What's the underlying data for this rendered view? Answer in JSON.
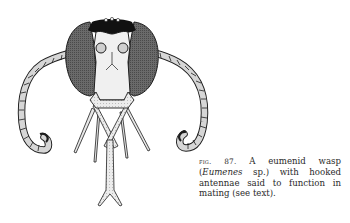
{
  "figure": {
    "parts": [
      "compound-eyes",
      "hooked-antennae",
      "antennal-sockets",
      "clypeus",
      "mandibles",
      "mouthparts"
    ],
    "colors": {
      "ink": "#1e1e1e",
      "eye_fill": "#5a5a5a",
      "pale_fill": "#e6e6e6",
      "mid_fill": "#bdbdbd",
      "paper": "#ffffff"
    }
  },
  "caption": {
    "label": "fig. 87.",
    "text_before_italic": " A eumenid wasp (",
    "italic": "Eumenes",
    "text_after_italic": " sp.) with hooked antennae said to function in mating (see text)."
  }
}
